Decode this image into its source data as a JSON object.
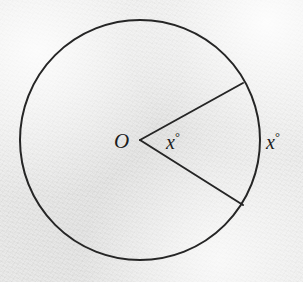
{
  "figure": {
    "kind": "circle-sector-geometry-diagram",
    "background_color": "#ececeb",
    "stroke_color": "#252525",
    "stroke_width": 2,
    "circle": {
      "center_x": 140,
      "center_y": 140,
      "radius": 120
    },
    "radii": [
      {
        "name": "upper-radius",
        "end_x": 243,
        "end_y": 83
      },
      {
        "name": "lower-radius",
        "end_x": 243,
        "end_y": 205
      }
    ],
    "labels": {
      "center_point": "O",
      "central_angle_value": "x",
      "central_angle_unit": "°",
      "arc_value": "x",
      "arc_unit": "°"
    }
  }
}
